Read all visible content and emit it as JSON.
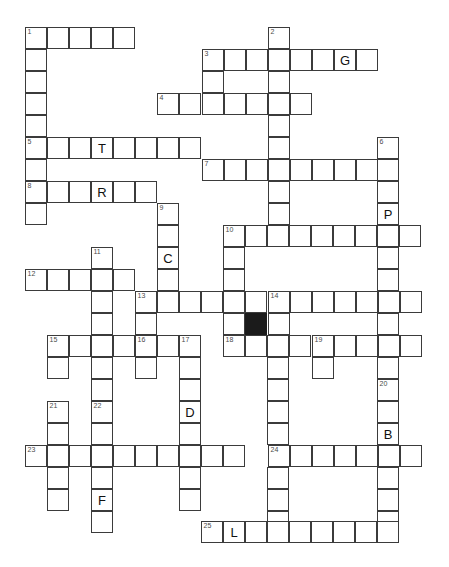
{
  "puzzle": {
    "type": "crossword-grid",
    "title": "Crossword Puzzle Grid",
    "cell_size_px": 22,
    "grid_origin": {
      "x": 25,
      "y": 27
    },
    "colors": {
      "cell_fill": "#ffffff",
      "cell_border": "#3b3b3b",
      "block_fill": "#1b1b1b",
      "number_text": "#4a4a4a",
      "letter_text": "#111111",
      "page_background": "#ffffff"
    },
    "counts": {
      "clue_numbers": 25,
      "filled_letters": 9,
      "blocked_cells": 1
    },
    "entries": [
      {
        "number": 1,
        "direction": "across-and-down",
        "x": 25,
        "y": 27,
        "length_across": 5,
        "length_down": 8
      },
      {
        "number": 2,
        "direction": "down",
        "x": 268,
        "y": 27,
        "length_down": 7
      },
      {
        "number": 3,
        "direction": "across-and-down",
        "x": 202,
        "y": 49,
        "length_across": 8,
        "length_down": 3
      },
      {
        "number": 4,
        "direction": "across",
        "x": 157,
        "y": 93,
        "length_across": 6
      },
      {
        "number": 5,
        "direction": "across",
        "x": 25,
        "y": 137,
        "length_across": 8
      },
      {
        "number": 6,
        "direction": "down",
        "x": 377,
        "y": 137,
        "length_down": 6
      },
      {
        "number": 7,
        "direction": "across",
        "x": 202,
        "y": 159,
        "length_across": 9
      },
      {
        "number": 8,
        "direction": "across",
        "x": 25,
        "y": 181,
        "length_across": 6
      },
      {
        "number": 9,
        "direction": "down",
        "x": 157,
        "y": 203,
        "length_down": 5
      },
      {
        "number": 10,
        "direction": "across-and-down",
        "x": 223,
        "y": 225,
        "length_across": 9,
        "length_down": 4
      },
      {
        "number": 11,
        "direction": "down",
        "x": 91,
        "y": 247,
        "length_down": 6
      },
      {
        "number": 12,
        "direction": "across",
        "x": 25,
        "y": 269,
        "length_across": 5
      },
      {
        "number": 13,
        "direction": "across",
        "x": 135,
        "y": 291,
        "length_across": 13
      },
      {
        "number": 14,
        "direction": "down",
        "x": 268,
        "y": 291,
        "length_down": 5
      },
      {
        "number": 15,
        "direction": "across",
        "x": 47,
        "y": 335,
        "length_across": 5
      },
      {
        "number": 16,
        "direction": "down",
        "x": 135,
        "y": 335,
        "length_down": 3
      },
      {
        "number": 17,
        "direction": "down",
        "x": 179,
        "y": 335,
        "length_down": 9
      },
      {
        "number": 18,
        "direction": "across",
        "x": 223,
        "y": 335,
        "length_across": 9
      },
      {
        "number": 19,
        "direction": "down",
        "x": 312,
        "y": 335,
        "length_down": 3
      },
      {
        "number": 20,
        "direction": "down",
        "x": 377,
        "y": 379,
        "length_down": 8
      },
      {
        "number": 21,
        "direction": "down",
        "x": 47,
        "y": 401,
        "length_down": 6
      },
      {
        "number": 22,
        "direction": "down",
        "x": 91,
        "y": 401,
        "length_down": 7
      },
      {
        "number": 23,
        "direction": "across",
        "x": 25,
        "y": 445,
        "length_across": 10
      },
      {
        "number": 24,
        "direction": "across",
        "x": 268,
        "y": 445,
        "length_across": 7
      },
      {
        "number": 25,
        "direction": "across",
        "x": 201,
        "y": 521,
        "length_across": 8
      }
    ],
    "letters": [
      {
        "letter": "G",
        "x": 334,
        "y": 49,
        "entry": 3
      },
      {
        "letter": "T",
        "x": 91,
        "y": 137,
        "entry": 5
      },
      {
        "letter": "R",
        "x": 91,
        "y": 181,
        "entry": 8
      },
      {
        "letter": "P",
        "x": 377,
        "y": 203,
        "entry": 6
      },
      {
        "letter": "C",
        "x": 157,
        "y": 247,
        "entry": 9
      },
      {
        "letter": "D",
        "x": 179,
        "y": 401,
        "entry": 17
      },
      {
        "letter": "B",
        "x": 377,
        "y": 423,
        "entry": 20
      },
      {
        "letter": "F",
        "x": 91,
        "y": 489,
        "entry": 22
      },
      {
        "letter": "L",
        "x": 223,
        "y": 521,
        "entry": 25
      }
    ],
    "blocks": [
      {
        "x": 245,
        "y": 313
      }
    ],
    "cells": [
      {
        "x": 25,
        "y": 27,
        "num": 1
      },
      {
        "x": 47,
        "y": 27
      },
      {
        "x": 69,
        "y": 27
      },
      {
        "x": 91,
        "y": 27
      },
      {
        "x": 113,
        "y": 27
      },
      {
        "x": 268,
        "y": 27,
        "num": 2
      },
      {
        "x": 25,
        "y": 49
      },
      {
        "x": 268,
        "y": 49
      },
      {
        "x": 202,
        "y": 49,
        "num": 3
      },
      {
        "x": 224,
        "y": 49
      },
      {
        "x": 246,
        "y": 49
      },
      {
        "x": 290,
        "y": 49
      },
      {
        "x": 312,
        "y": 49
      },
      {
        "x": 334,
        "y": 49,
        "letter": "G"
      },
      {
        "x": 356,
        "y": 49
      },
      {
        "x": 25,
        "y": 71
      },
      {
        "x": 202,
        "y": 71
      },
      {
        "x": 268,
        "y": 71
      },
      {
        "x": 25,
        "y": 93
      },
      {
        "x": 202,
        "y": 93
      },
      {
        "x": 268,
        "y": 93
      },
      {
        "x": 157,
        "y": 93,
        "num": 4
      },
      {
        "x": 179,
        "y": 93
      },
      {
        "x": 224,
        "y": 93
      },
      {
        "x": 246,
        "y": 93
      },
      {
        "x": 290,
        "y": 93
      },
      {
        "x": 25,
        "y": 115
      },
      {
        "x": 268,
        "y": 115
      },
      {
        "x": 25,
        "y": 137,
        "num": 5
      },
      {
        "x": 47,
        "y": 137
      },
      {
        "x": 69,
        "y": 137
      },
      {
        "x": 91,
        "y": 137,
        "letter": "T"
      },
      {
        "x": 113,
        "y": 137
      },
      {
        "x": 135,
        "y": 137
      },
      {
        "x": 157,
        "y": 137
      },
      {
        "x": 179,
        "y": 137
      },
      {
        "x": 268,
        "y": 137
      },
      {
        "x": 377,
        "y": 137,
        "num": 6
      },
      {
        "x": 25,
        "y": 159
      },
      {
        "x": 377,
        "y": 159
      },
      {
        "x": 202,
        "y": 159,
        "num": 7
      },
      {
        "x": 224,
        "y": 159
      },
      {
        "x": 246,
        "y": 159
      },
      {
        "x": 268,
        "y": 159
      },
      {
        "x": 290,
        "y": 159
      },
      {
        "x": 312,
        "y": 159
      },
      {
        "x": 334,
        "y": 159
      },
      {
        "x": 356,
        "y": 159
      },
      {
        "x": 25,
        "y": 181,
        "num": 8
      },
      {
        "x": 47,
        "y": 181
      },
      {
        "x": 69,
        "y": 181
      },
      {
        "x": 91,
        "y": 181,
        "letter": "R"
      },
      {
        "x": 113,
        "y": 181
      },
      {
        "x": 135,
        "y": 181
      },
      {
        "x": 268,
        "y": 181
      },
      {
        "x": 377,
        "y": 181
      },
      {
        "x": 25,
        "y": 203
      },
      {
        "x": 268,
        "y": 203
      },
      {
        "x": 157,
        "y": 203,
        "num": 9
      },
      {
        "x": 377,
        "y": 203,
        "letter": "P"
      },
      {
        "x": 157,
        "y": 225
      },
      {
        "x": 223,
        "y": 225,
        "num": 10
      },
      {
        "x": 245,
        "y": 225
      },
      {
        "x": 267,
        "y": 225
      },
      {
        "x": 289,
        "y": 225
      },
      {
        "x": 311,
        "y": 225
      },
      {
        "x": 333,
        "y": 225
      },
      {
        "x": 355,
        "y": 225
      },
      {
        "x": 377,
        "y": 225
      },
      {
        "x": 399,
        "y": 225
      },
      {
        "x": 157,
        "y": 247,
        "letter": "C"
      },
      {
        "x": 91,
        "y": 247,
        "num": 11
      },
      {
        "x": 223,
        "y": 247
      },
      {
        "x": 377,
        "y": 247
      },
      {
        "x": 25,
        "y": 269,
        "num": 12
      },
      {
        "x": 47,
        "y": 269
      },
      {
        "x": 69,
        "y": 269
      },
      {
        "x": 91,
        "y": 269
      },
      {
        "x": 113,
        "y": 269
      },
      {
        "x": 157,
        "y": 269
      },
      {
        "x": 223,
        "y": 269
      },
      {
        "x": 377,
        "y": 269
      },
      {
        "x": 135,
        "y": 291,
        "num": 13
      },
      {
        "x": 157,
        "y": 291
      },
      {
        "x": 179,
        "y": 291
      },
      {
        "x": 201,
        "y": 291
      },
      {
        "x": 223,
        "y": 291
      },
      {
        "x": 245,
        "y": 291
      },
      {
        "x": 268,
        "y": 291,
        "num": 14
      },
      {
        "x": 290,
        "y": 291
      },
      {
        "x": 312,
        "y": 291
      },
      {
        "x": 334,
        "y": 291
      },
      {
        "x": 356,
        "y": 291
      },
      {
        "x": 378,
        "y": 291
      },
      {
        "x": 400,
        "y": 291
      },
      {
        "x": 91,
        "y": 291
      },
      {
        "x": 91,
        "y": 313
      },
      {
        "x": 135,
        "y": 313
      },
      {
        "x": 223,
        "y": 313
      },
      {
        "x": 245,
        "y": 313,
        "block": true
      },
      {
        "x": 268,
        "y": 313
      },
      {
        "x": 377,
        "y": 313
      },
      {
        "x": 47,
        "y": 335,
        "num": 15
      },
      {
        "x": 69,
        "y": 335
      },
      {
        "x": 91,
        "y": 335
      },
      {
        "x": 113,
        "y": 335
      },
      {
        "x": 135,
        "y": 335,
        "num": 16
      },
      {
        "x": 157,
        "y": 335
      },
      {
        "x": 179,
        "y": 335,
        "num": 17
      },
      {
        "x": 223,
        "y": 335,
        "num": 18
      },
      {
        "x": 245,
        "y": 335
      },
      {
        "x": 267,
        "y": 335
      },
      {
        "x": 289,
        "y": 335
      },
      {
        "x": 312,
        "y": 335,
        "num": 19
      },
      {
        "x": 334,
        "y": 335
      },
      {
        "x": 356,
        "y": 335
      },
      {
        "x": 378,
        "y": 335
      },
      {
        "x": 400,
        "y": 335
      },
      {
        "x": 47,
        "y": 357
      },
      {
        "x": 91,
        "y": 357
      },
      {
        "x": 135,
        "y": 357
      },
      {
        "x": 179,
        "y": 357
      },
      {
        "x": 267,
        "y": 357
      },
      {
        "x": 312,
        "y": 357
      },
      {
        "x": 377,
        "y": 357
      },
      {
        "x": 91,
        "y": 379
      },
      {
        "x": 179,
        "y": 379
      },
      {
        "x": 267,
        "y": 379
      },
      {
        "x": 377,
        "y": 379,
        "num": 20
      },
      {
        "x": 47,
        "y": 401,
        "num": 21
      },
      {
        "x": 91,
        "y": 401,
        "num": 22
      },
      {
        "x": 179,
        "y": 401,
        "letter": "D"
      },
      {
        "x": 267,
        "y": 401
      },
      {
        "x": 377,
        "y": 401
      },
      {
        "x": 47,
        "y": 423
      },
      {
        "x": 91,
        "y": 423
      },
      {
        "x": 179,
        "y": 423
      },
      {
        "x": 267,
        "y": 423
      },
      {
        "x": 377,
        "y": 423,
        "letter": "B"
      },
      {
        "x": 25,
        "y": 445,
        "num": 23
      },
      {
        "x": 47,
        "y": 445
      },
      {
        "x": 69,
        "y": 445
      },
      {
        "x": 91,
        "y": 445
      },
      {
        "x": 113,
        "y": 445
      },
      {
        "x": 135,
        "y": 445
      },
      {
        "x": 157,
        "y": 445
      },
      {
        "x": 179,
        "y": 445
      },
      {
        "x": 201,
        "y": 445
      },
      {
        "x": 223,
        "y": 445
      },
      {
        "x": 268,
        "y": 445,
        "num": 24
      },
      {
        "x": 290,
        "y": 445
      },
      {
        "x": 312,
        "y": 445
      },
      {
        "x": 334,
        "y": 445
      },
      {
        "x": 356,
        "y": 445
      },
      {
        "x": 378,
        "y": 445
      },
      {
        "x": 400,
        "y": 445
      },
      {
        "x": 47,
        "y": 467
      },
      {
        "x": 91,
        "y": 467
      },
      {
        "x": 179,
        "y": 467
      },
      {
        "x": 267,
        "y": 467
      },
      {
        "x": 377,
        "y": 467
      },
      {
        "x": 47,
        "y": 489
      },
      {
        "x": 91,
        "y": 489,
        "letter": "F"
      },
      {
        "x": 179,
        "y": 489
      },
      {
        "x": 267,
        "y": 489
      },
      {
        "x": 377,
        "y": 489
      },
      {
        "x": 91,
        "y": 511
      },
      {
        "x": 267,
        "y": 511
      },
      {
        "x": 377,
        "y": 511
      },
      {
        "x": 201,
        "y": 521,
        "num": 25
      },
      {
        "x": 223,
        "y": 521,
        "letter": "L"
      },
      {
        "x": 245,
        "y": 521
      },
      {
        "x": 267,
        "y": 521
      },
      {
        "x": 289,
        "y": 521
      },
      {
        "x": 311,
        "y": 521
      },
      {
        "x": 333,
        "y": 521
      },
      {
        "x": 355,
        "y": 521
      },
      {
        "x": 377,
        "y": 521
      }
    ]
  }
}
